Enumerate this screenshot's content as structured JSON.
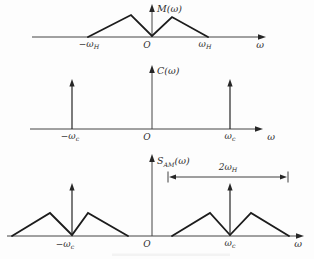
{
  "figure": {
    "bg_color": "#fdfdfd",
    "curve_color": "#1c1c1c",
    "axis_color": "#454545",
    "text_color": "#2e2e2e"
  },
  "plots": [
    {
      "name": "message-spectrum",
      "y_axis_label": "M(ω)",
      "x_axis_label": "ω",
      "origin_label": "O",
      "tick_left": {
        "base": "−ω",
        "sub": "H"
      },
      "tick_right": {
        "base": "ω",
        "sub": "H"
      },
      "curve_points": "88,37 131,15 152,36 172,17 208,37"
    },
    {
      "name": "carrier-spectrum",
      "y_axis_label": "C(ω)",
      "x_axis_label": "ω",
      "origin_label": "O",
      "tick_left": {
        "base": "−ω",
        "sub": "c"
      },
      "tick_right": {
        "base": "ω",
        "sub": "c"
      },
      "impulse_left_points": "72,129 72,84",
      "impulse_right_points": "230,129 230,84"
    },
    {
      "name": "am-spectrum",
      "y_label_base": "S",
      "y_label_sub": "AM",
      "y_label_rest": "(ω)",
      "x_axis_label": "ω",
      "origin_label": "O",
      "tick_left": {
        "base": "−ω",
        "sub": "c"
      },
      "tick_right": {
        "base": "ω",
        "sub": "c"
      },
      "lower_sideband_points": "12,236 50,213 72,235 88,213 128,236",
      "upper_sideband_points": "172,236 210,213 230,235 251,213 289,236",
      "impulse_left_points": "72,236 72,188",
      "impulse_right_points": "230,236 230,188",
      "bandwidth_label": {
        "base": "2ω",
        "sub": "H"
      }
    }
  ]
}
